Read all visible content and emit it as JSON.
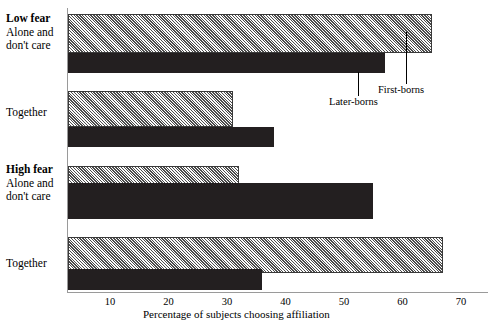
{
  "chart_data": {
    "type": "bar",
    "orientation": "horizontal",
    "title": "",
    "xlabel": "Percentage of subjects choosing affiliation",
    "ylabel": "",
    "xlim": [
      0,
      75
    ],
    "grid": false,
    "legend_position": "annotated-callouts",
    "xticks": [
      10,
      20,
      30,
      40,
      50,
      60,
      70
    ],
    "xtick_labels": [
      "10",
      "20",
      "30",
      "40",
      "50",
      "60",
      "70"
    ],
    "groups": [
      {
        "group_label": "Low fear",
        "group_label_bold": true,
        "categories": [
          {
            "label_line1": "Alone and",
            "label_line2": "don't care"
          },
          {
            "label_line1": "Together",
            "label_line2": ""
          }
        ]
      },
      {
        "group_label": "High fear",
        "group_label_bold": true,
        "categories": [
          {
            "label_line1": "Alone and",
            "label_line2": "don't care"
          },
          {
            "label_line1": "Together",
            "label_line2": ""
          }
        ]
      }
    ],
    "categories": [
      "Low fear / Alone and don't care",
      "Low fear / Together",
      "High fear / Alone and don't care",
      "High fear / Together"
    ],
    "series": [
      {
        "name": "First-borns",
        "color": "#b4b4b4",
        "pattern": "diagonal-hatch",
        "values": [
          65,
          31,
          32,
          67
        ]
      },
      {
        "name": "Later-borns",
        "color": "#231f20",
        "pattern": "solid",
        "values": [
          57,
          38,
          55,
          36
        ]
      }
    ],
    "annotations": [
      {
        "text": "First-borns",
        "series": "First-borns"
      },
      {
        "text": "Later-borns",
        "series": "Later-borns"
      }
    ]
  },
  "labels": {
    "low_fear": "Low fear",
    "high_fear": "High fear",
    "alone_line1": "Alone and",
    "alone_line2": "don't care",
    "together": "Together",
    "axis_title": "Percentage of subjects choosing affiliation",
    "first_borns": "First-borns",
    "later_borns": "Later-borns"
  },
  "ticks": {
    "t10": "10",
    "t20": "20",
    "t30": "30",
    "t40": "40",
    "t50": "50",
    "t60": "60",
    "t70": "70"
  }
}
